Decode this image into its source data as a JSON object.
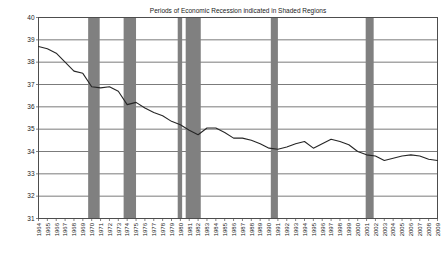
{
  "chart_data": {
    "type": "line",
    "title": "Periods of Economic Recession indicated in Shaded Regions",
    "xlabel": "",
    "ylabel": "",
    "ylim": [
      31,
      40
    ],
    "ytick_values": [
      31,
      32,
      33,
      34,
      35,
      36,
      37,
      38,
      39,
      40
    ],
    "ytick_labels": [
      "31",
      "32",
      "33",
      "34",
      "35",
      "36",
      "37",
      "38",
      "39",
      "40"
    ],
    "grid": true,
    "legend_position": "none",
    "line_color": "#262626",
    "shaded_region_color": "#808080",
    "x": [
      1964,
      1965,
      1966,
      1967,
      1968,
      1969,
      1970,
      1971,
      1972,
      1973,
      1974,
      1975,
      1976,
      1977,
      1978,
      1979,
      1980,
      1981,
      1982,
      1983,
      1984,
      1985,
      1986,
      1987,
      1988,
      1989,
      1990,
      1991,
      1992,
      1993,
      1994,
      1995,
      1996,
      1997,
      1998,
      1999,
      2000,
      2001,
      2002,
      2003,
      2004,
      2005,
      2006,
      2007,
      2008,
      2009
    ],
    "xtick_labels": [
      "1964",
      "1965",
      "1966",
      "1967",
      "1968",
      "1969",
      "1970",
      "1971",
      "1972",
      "1973",
      "1974",
      "1975",
      "1976",
      "1977",
      "1978",
      "1979",
      "1980",
      "1981",
      "1982",
      "1983",
      "1984",
      "1985",
      "1986",
      "1987",
      "1988",
      "1989",
      "1990",
      "1991",
      "1992",
      "1993",
      "1994",
      "1995",
      "1996",
      "1997",
      "1998",
      "1999",
      "2000",
      "2001",
      "2002",
      "2003",
      "2004",
      "2005",
      "2006",
      "2007",
      "2008",
      "2009"
    ],
    "values": [
      38.7,
      38.6,
      38.4,
      38.0,
      37.6,
      37.5,
      36.9,
      36.85,
      36.9,
      36.7,
      36.1,
      36.2,
      35.95,
      35.75,
      35.6,
      35.35,
      35.2,
      34.95,
      34.75,
      35.05,
      35.05,
      34.85,
      34.6,
      34.6,
      34.5,
      34.35,
      34.15,
      34.1,
      34.2,
      34.35,
      34.45,
      34.15,
      34.35,
      34.55,
      34.45,
      34.3,
      34.0,
      33.85,
      33.8,
      33.6,
      33.7,
      33.8,
      33.85,
      33.8,
      33.65,
      33.6
    ],
    "series": [
      {
        "name": "value",
        "values": [
          38.7,
          38.6,
          38.4,
          38.0,
          37.6,
          37.5,
          36.9,
          36.85,
          36.9,
          36.7,
          36.1,
          36.2,
          35.95,
          35.75,
          35.6,
          35.35,
          35.2,
          34.95,
          34.75,
          35.05,
          35.05,
          34.85,
          34.6,
          34.6,
          34.5,
          34.35,
          34.15,
          34.1,
          34.2,
          34.35,
          34.45,
          34.15,
          34.35,
          34.55,
          34.45,
          34.3,
          34.0,
          33.85,
          33.8,
          33.6,
          33.7,
          33.8,
          33.85,
          33.8,
          33.65,
          33.6
        ]
      }
    ],
    "shaded_regions": [
      {
        "label": "recession-1969-1970",
        "start": 1969.6,
        "end": 1970.9
      },
      {
        "label": "recession-1973-1975",
        "start": 1973.6,
        "end": 1975.0
      },
      {
        "label": "recession-1980",
        "start": 1979.7,
        "end": 1980.2
      },
      {
        "label": "recession-1981-1982",
        "start": 1980.6,
        "end": 1982.3
      },
      {
        "label": "recession-1990-1991",
        "start": 1990.2,
        "end": 1991.0
      },
      {
        "label": "recession-2001",
        "start": 2000.9,
        "end": 2001.8
      }
    ],
    "annotations": [
      "Periods of Economic Recession indicated in Shaded Regions"
    ]
  }
}
